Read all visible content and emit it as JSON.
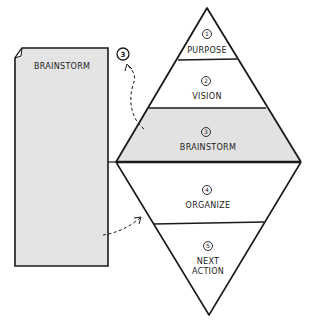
{
  "diagram": {
    "type": "natural-planning-model",
    "page": {
      "label": "BRAINSTORM",
      "fill": "#e4e4e4"
    },
    "callout": {
      "number": "3"
    },
    "stages": [
      {
        "number": "1",
        "label": "PURPOSE",
        "lines": [
          "PURPOSE"
        ],
        "highlighted": false
      },
      {
        "number": "2",
        "label": "VISION",
        "lines": [
          "VISION"
        ],
        "highlighted": false
      },
      {
        "number": "3",
        "label": "BRAINSTORM",
        "lines": [
          "BRAINSTORM"
        ],
        "highlighted": true
      },
      {
        "number": "4",
        "label": "ORGANIZE",
        "lines": [
          "ORGANIZE"
        ],
        "highlighted": false
      },
      {
        "number": "5",
        "label": "NEXT ACTION",
        "lines": [
          "NEXT",
          "ACTION"
        ],
        "highlighted": false
      }
    ],
    "colors": {
      "stroke": "#1a1a1a",
      "highlight": "#e2e2e2",
      "page_fill": "#e4e4e4",
      "background": "#ffffff"
    }
  }
}
